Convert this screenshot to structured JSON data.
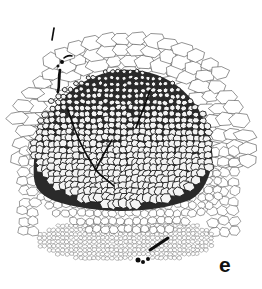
{
  "figure": {
    "panel_label": "e",
    "colors": {
      "background": "#ffffff",
      "outline": "#3a3a3a",
      "dense_zone": "#1a1a1a",
      "thread": "#0d0d0d",
      "label": "#111111"
    }
  }
}
